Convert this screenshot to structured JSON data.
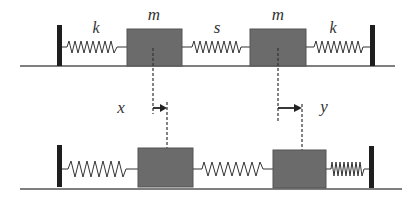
{
  "diagram": {
    "colors": {
      "mass": "#6b6b6b",
      "mass_border": "#555555",
      "wall": "#1e1e1e",
      "spring": "#333333",
      "ground": "#555555",
      "dash": "#333333",
      "arrow": "#222222"
    },
    "top_row": {
      "labels": {
        "spring_left": "k",
        "mass_left": "m",
        "spring_middle": "s",
        "mass_right": "m",
        "spring_right": "k"
      }
    },
    "displacements": {
      "left": "x",
      "right": "y"
    }
  }
}
